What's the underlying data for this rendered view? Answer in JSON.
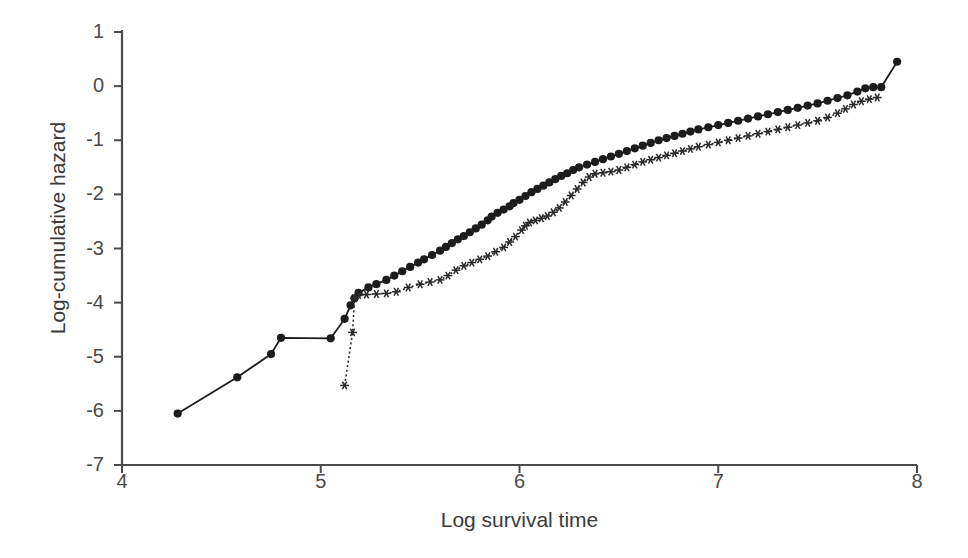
{
  "chart_data": {
    "type": "line",
    "title": "",
    "xlabel": "Log survival time",
    "ylabel": "Log-cumulative hazard",
    "xlim": [
      4,
      8
    ],
    "ylim": [
      -7,
      1
    ],
    "xticks": [
      4,
      5,
      6,
      7,
      8
    ],
    "yticks": [
      1,
      0,
      -1,
      -2,
      -3,
      -4,
      -5,
      -6,
      -7
    ],
    "grid": false,
    "legend": "none",
    "series": [
      {
        "name": "group-circles",
        "marker": "filled-circle",
        "linestyle": "solid",
        "color": "#1c1c1c",
        "points": [
          [
            4.28,
            -6.05
          ],
          [
            4.58,
            -5.38
          ],
          [
            4.75,
            -4.95
          ],
          [
            4.8,
            -4.65
          ],
          [
            5.05,
            -4.66
          ],
          [
            5.12,
            -4.3
          ],
          [
            5.15,
            -4.05
          ],
          [
            5.17,
            -3.92
          ],
          [
            5.19,
            -3.82
          ],
          [
            5.24,
            -3.72
          ],
          [
            5.28,
            -3.66
          ],
          [
            5.33,
            -3.58
          ],
          [
            5.37,
            -3.5
          ],
          [
            5.41,
            -3.42
          ],
          [
            5.45,
            -3.34
          ],
          [
            5.49,
            -3.26
          ],
          [
            5.52,
            -3.2
          ],
          [
            5.56,
            -3.12
          ],
          [
            5.6,
            -3.04
          ],
          [
            5.63,
            -2.97
          ],
          [
            5.66,
            -2.9
          ],
          [
            5.69,
            -2.83
          ],
          [
            5.72,
            -2.77
          ],
          [
            5.75,
            -2.7
          ],
          [
            5.78,
            -2.63
          ],
          [
            5.81,
            -2.56
          ],
          [
            5.84,
            -2.48
          ],
          [
            5.86,
            -2.41
          ],
          [
            5.89,
            -2.34
          ],
          [
            5.92,
            -2.28
          ],
          [
            5.95,
            -2.22
          ],
          [
            5.97,
            -2.16
          ],
          [
            6.0,
            -2.1
          ],
          [
            6.03,
            -2.03
          ],
          [
            6.06,
            -1.96
          ],
          [
            6.09,
            -1.9
          ],
          [
            6.12,
            -1.84
          ],
          [
            6.15,
            -1.78
          ],
          [
            6.18,
            -1.72
          ],
          [
            6.21,
            -1.66
          ],
          [
            6.24,
            -1.61
          ],
          [
            6.27,
            -1.55
          ],
          [
            6.3,
            -1.5
          ],
          [
            6.34,
            -1.45
          ],
          [
            6.38,
            -1.4
          ],
          [
            6.42,
            -1.35
          ],
          [
            6.46,
            -1.3
          ],
          [
            6.5,
            -1.25
          ],
          [
            6.54,
            -1.2
          ],
          [
            6.58,
            -1.15
          ],
          [
            6.62,
            -1.1
          ],
          [
            6.66,
            -1.05
          ],
          [
            6.7,
            -1.0
          ],
          [
            6.74,
            -0.96
          ],
          [
            6.78,
            -0.92
          ],
          [
            6.82,
            -0.88
          ],
          [
            6.86,
            -0.84
          ],
          [
            6.9,
            -0.8
          ],
          [
            6.95,
            -0.76
          ],
          [
            7.0,
            -0.72
          ],
          [
            7.05,
            -0.68
          ],
          [
            7.1,
            -0.64
          ],
          [
            7.15,
            -0.6
          ],
          [
            7.2,
            -0.56
          ],
          [
            7.25,
            -0.52
          ],
          [
            7.3,
            -0.48
          ],
          [
            7.35,
            -0.44
          ],
          [
            7.4,
            -0.4
          ],
          [
            7.45,
            -0.36
          ],
          [
            7.5,
            -0.32
          ],
          [
            7.55,
            -0.27
          ],
          [
            7.6,
            -0.22
          ],
          [
            7.65,
            -0.17
          ],
          [
            7.7,
            -0.1
          ],
          [
            7.74,
            -0.04
          ],
          [
            7.78,
            -0.02
          ],
          [
            7.82,
            -0.02
          ],
          [
            7.9,
            0.45
          ]
        ]
      },
      {
        "name": "group-asterisks",
        "marker": "asterisk",
        "linestyle": "dotted",
        "color": "#2a2a2a",
        "points": [
          [
            5.12,
            -5.53
          ],
          [
            5.16,
            -4.55
          ],
          [
            5.17,
            -3.92
          ],
          [
            5.19,
            -3.86
          ],
          [
            5.23,
            -3.85
          ],
          [
            5.28,
            -3.84
          ],
          [
            5.33,
            -3.83
          ],
          [
            5.38,
            -3.8
          ],
          [
            5.44,
            -3.72
          ],
          [
            5.5,
            -3.66
          ],
          [
            5.55,
            -3.62
          ],
          [
            5.6,
            -3.58
          ],
          [
            5.64,
            -3.5
          ],
          [
            5.68,
            -3.4
          ],
          [
            5.72,
            -3.32
          ],
          [
            5.76,
            -3.26
          ],
          [
            5.8,
            -3.2
          ],
          [
            5.84,
            -3.14
          ],
          [
            5.88,
            -3.06
          ],
          [
            5.92,
            -2.98
          ],
          [
            5.95,
            -2.88
          ],
          [
            5.98,
            -2.78
          ],
          [
            6.01,
            -2.66
          ],
          [
            6.03,
            -2.58
          ],
          [
            6.05,
            -2.52
          ],
          [
            6.08,
            -2.48
          ],
          [
            6.11,
            -2.44
          ],
          [
            6.14,
            -2.4
          ],
          [
            6.17,
            -2.33
          ],
          [
            6.2,
            -2.25
          ],
          [
            6.23,
            -2.14
          ],
          [
            6.26,
            -2.02
          ],
          [
            6.29,
            -1.9
          ],
          [
            6.32,
            -1.78
          ],
          [
            6.35,
            -1.68
          ],
          [
            6.38,
            -1.62
          ],
          [
            6.42,
            -1.6
          ],
          [
            6.46,
            -1.58
          ],
          [
            6.5,
            -1.55
          ],
          [
            6.54,
            -1.5
          ],
          [
            6.58,
            -1.45
          ],
          [
            6.62,
            -1.4
          ],
          [
            6.66,
            -1.36
          ],
          [
            6.7,
            -1.32
          ],
          [
            6.74,
            -1.28
          ],
          [
            6.78,
            -1.24
          ],
          [
            6.82,
            -1.2
          ],
          [
            6.86,
            -1.16
          ],
          [
            6.9,
            -1.12
          ],
          [
            6.95,
            -1.08
          ],
          [
            7.0,
            -1.04
          ],
          [
            7.05,
            -1.0
          ],
          [
            7.1,
            -0.96
          ],
          [
            7.15,
            -0.92
          ],
          [
            7.2,
            -0.88
          ],
          [
            7.25,
            -0.84
          ],
          [
            7.3,
            -0.8
          ],
          [
            7.35,
            -0.76
          ],
          [
            7.4,
            -0.72
          ],
          [
            7.45,
            -0.68
          ],
          [
            7.5,
            -0.64
          ],
          [
            7.55,
            -0.58
          ],
          [
            7.6,
            -0.5
          ],
          [
            7.64,
            -0.42
          ],
          [
            7.68,
            -0.34
          ],
          [
            7.72,
            -0.28
          ],
          [
            7.76,
            -0.24
          ],
          [
            7.8,
            -0.21
          ]
        ]
      }
    ]
  }
}
